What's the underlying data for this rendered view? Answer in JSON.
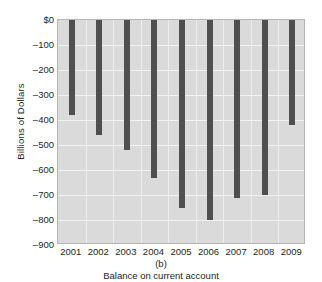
{
  "chart_data": {
    "type": "bar",
    "title": "",
    "panel_letter": "(b)",
    "caption": "Balance on current account",
    "xlabel": "",
    "ylabel": "Billions of Dollars",
    "categories": [
      "2001",
      "2002",
      "2003",
      "2004",
      "2005",
      "2006",
      "2007",
      "2008",
      "2009"
    ],
    "values": [
      -380,
      -460,
      -520,
      -630,
      -750,
      -800,
      -710,
      -700,
      -420
    ],
    "ylim": [
      -900,
      0
    ],
    "ytick_values": [
      0,
      -100,
      -200,
      -300,
      -400,
      -500,
      -600,
      -700,
      -800,
      -900
    ],
    "ytick_labels": [
      "$0",
      "–100",
      "–200",
      "–300",
      "–400",
      "–500",
      "–600",
      "–700",
      "–800",
      "–900"
    ],
    "grid": true,
    "legend": "none",
    "bar_color": "#4f4f4f",
    "plot_background": "#dadada",
    "gridline_color": "#f2f2f2"
  }
}
